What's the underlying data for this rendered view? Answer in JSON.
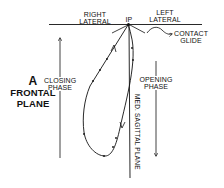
{
  "labels": {
    "right_lateral": [
      "RIGHT",
      "LATERAL"
    ],
    "left_lateral": [
      "LEFT",
      "LATERAL"
    ],
    "ip": "IP",
    "contact_glide": [
      "CONTACT",
      "GLIDE"
    ],
    "closing_phase": [
      "CLOSING",
      "PHASE"
    ],
    "opening_phase": [
      "OPENING",
      "PHASE"
    ],
    "panel_letter": "A",
    "plane_title": [
      "FRONTAL",
      "PLANE"
    ],
    "med_sagittal": "MED. SAGITTAL PLANE"
  },
  "colors": {
    "ink": "#111111",
    "background": "#ffffff"
  }
}
